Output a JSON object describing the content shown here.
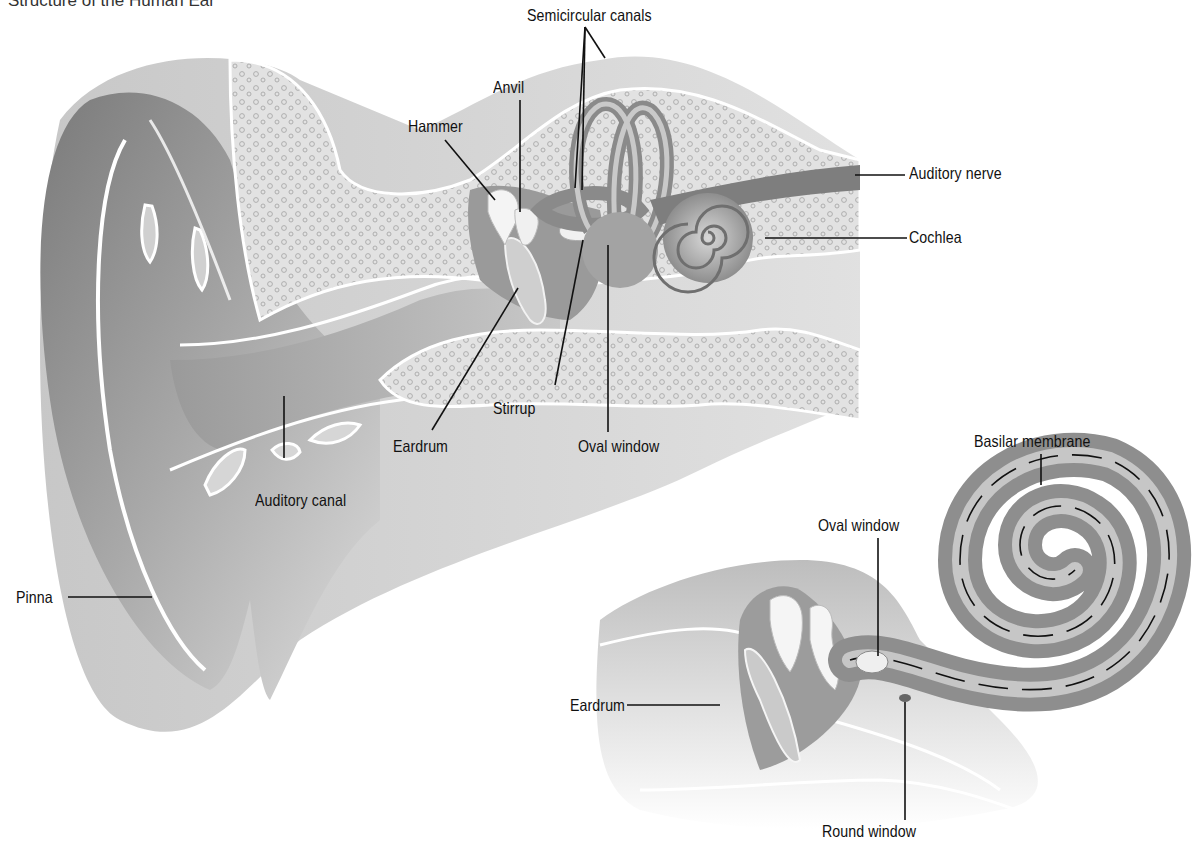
{
  "title": "Structure of the Human Ear",
  "main_diagram": {
    "labels": {
      "semicircular_canals": "Semicircular canals",
      "anvil": "Anvil",
      "hammer": "Hammer",
      "auditory_nerve": "Auditory nerve",
      "cochlea": "Cochlea",
      "eardrum": "Eardrum",
      "stirrup": "Stirrup",
      "oval_window": "Oval window",
      "auditory_canal": "Auditory canal",
      "pinna": "Pinna"
    }
  },
  "inset_diagram": {
    "labels": {
      "basilar_membrane": "Basilar membrane",
      "oval_window": "Oval window",
      "eardrum": "Eardrum",
      "round_window": "Round window"
    }
  },
  "colors": {
    "background": "#ffffff",
    "tissue_dark": "#8c8c8c",
    "tissue_mid": "#b4b4b4",
    "tissue_light": "#d9d9d9",
    "bone": "#e6e6e6",
    "label_text": "#111111"
  }
}
